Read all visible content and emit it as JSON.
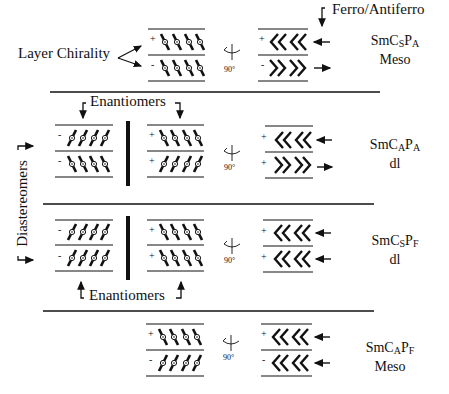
{
  "labels": {
    "layer_chirality": "Layer Chirality",
    "ferro_antiferro": "Ferro/Antiferro",
    "enantiomers_top": "Enantiomers",
    "enantiomers_bottom": "Enantiomers",
    "diastereomers": "Diastereomers",
    "rotation": "90°"
  },
  "rows": [
    {
      "phase_main": "SmC",
      "phase_sub1": "S",
      "phase_p": "P",
      "phase_sub2": "A",
      "type": "Meso",
      "left_signs": [
        "+",
        "-"
      ],
      "right_signs": [
        "+",
        "-"
      ]
    },
    {
      "phase_main": "SmC",
      "phase_sub1": "A",
      "phase_p": "P",
      "phase_sub2": "A",
      "type": "dl",
      "left_signs": [
        "-",
        "-"
      ],
      "mid_signs": [
        "+",
        "+"
      ],
      "right_signs": [
        "+",
        "+"
      ]
    },
    {
      "phase_main": "SmC",
      "phase_sub1": "S",
      "phase_p": "P",
      "phase_sub2": "F",
      "type": "dl",
      "left_signs": [
        "-",
        "-"
      ],
      "mid_signs": [
        "+",
        "+"
      ],
      "right_signs": [
        "+",
        "+"
      ]
    },
    {
      "phase_main": "SmC",
      "phase_sub1": "A",
      "phase_p": "P",
      "phase_sub2": "F",
      "type": "Meso",
      "left_signs": [
        "+",
        "-"
      ],
      "right_signs": [
        "+",
        "-"
      ]
    }
  ]
}
